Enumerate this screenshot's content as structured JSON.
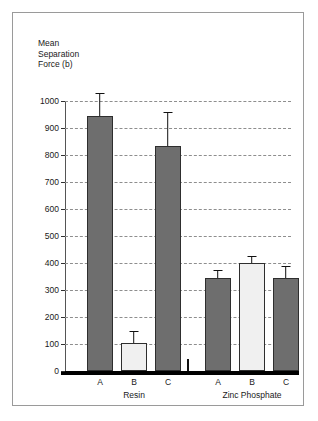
{
  "chart_data": {
    "type": "bar",
    "title": "",
    "xlabel": "",
    "ylabel": "Mean\nSeparation\nForce (b)",
    "ylim": [
      0,
      1000
    ],
    "ytick_labels": [
      "0",
      "100",
      "200",
      "300",
      "400",
      "500",
      "600",
      "700",
      "800",
      "900",
      "1000"
    ],
    "ytick_values": [
      0,
      100,
      200,
      300,
      400,
      500,
      600,
      700,
      800,
      900,
      1000
    ],
    "grid": true,
    "legend": "none",
    "groups": [
      {
        "name": "Resin",
        "categories": [
          "A",
          "B",
          "C"
        ],
        "values": [
          945,
          105,
          835
        ],
        "errors_upper": [
          1030,
          150,
          960
        ],
        "fills": [
          "dark",
          "light",
          "dark"
        ]
      },
      {
        "name": "Zinc Phosphate",
        "categories": [
          "A",
          "B",
          "C"
        ],
        "values": [
          345,
          400,
          345
        ],
        "errors_upper": [
          375,
          425,
          390
        ],
        "fills": [
          "dark",
          "light",
          "dark"
        ]
      }
    ],
    "colors": {
      "bar_dark": "#6e6e6e",
      "bar_light": "#f0f0f0",
      "bar_edge": "#2e2e2e",
      "gridline": "#8e8e8e",
      "baseline": "#000000",
      "frame": "#9a9a9a",
      "text": "#1a1a1a"
    }
  }
}
